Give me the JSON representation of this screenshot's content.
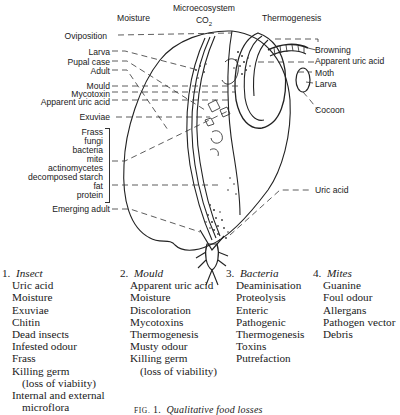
{
  "figure": {
    "header_labels": {
      "moisture": "Moisture",
      "microecosystem": "Microecosystem",
      "co2": "CO",
      "co2_sub": "2",
      "thermogenesis": "Thermogenesis"
    },
    "left_labels": [
      {
        "id": "oviposition",
        "text": "Oviposition"
      },
      {
        "id": "larva",
        "text": "Larva"
      },
      {
        "id": "pupal_case",
        "text": "Pupal case"
      },
      {
        "id": "adult",
        "text": "Adult"
      },
      {
        "id": "mould",
        "text": "Mould"
      },
      {
        "id": "mycotoxin",
        "text": "Mycotoxin"
      },
      {
        "id": "apparent_uric_acid",
        "text": "Apparent uric acid"
      },
      {
        "id": "exuviae",
        "text": "Exuviae"
      }
    ],
    "bracket_group": [
      "Frass",
      "fungi",
      "bacteria",
      "mite",
      "actinomycetes",
      "decomposed starch",
      "fat",
      "protein"
    ],
    "emerging_adult": "Emerging adult",
    "right_labels": [
      {
        "id": "browning",
        "text": "Browning"
      },
      {
        "id": "apparent_uric_acid_r",
        "text": "Apparent uric acid"
      },
      {
        "id": "moth",
        "text": "Moth"
      },
      {
        "id": "larva_r",
        "text": "Larva"
      },
      {
        "id": "cocoon",
        "text": "Cocoon"
      },
      {
        "id": "uric_acid",
        "text": "Uric acid"
      }
    ]
  },
  "categories": [
    {
      "number": "1.",
      "title": "Insect",
      "items": [
        "Uric acid",
        "Moisture",
        "Exuviae",
        "Chitin",
        "Dead insects",
        "Infested odour",
        "Frass",
        "Killing germ",
        "(loss of viabiity)",
        "Internal and external",
        "microflora"
      ]
    },
    {
      "number": "2.",
      "title": "Mould",
      "items": [
        "Apparent uric acid",
        "Moisture",
        "Discoloration",
        "Mycotoxins",
        "Thermogenesis",
        "Musty odour",
        "Killing germ",
        "(loss of viability)"
      ]
    },
    {
      "number": "3.",
      "title": "Bacteria",
      "items": [
        "Deaminisation",
        "Proteolysis",
        "Enteric",
        "Pathogenic",
        "Thermogenesis",
        "Toxins",
        "Putrefaction"
      ]
    },
    {
      "number": "4.",
      "title": "Mites",
      "items": [
        "Guanine",
        "Foul odour",
        "Allergans",
        "Pathogen vector",
        "Debris"
      ]
    }
  ],
  "caption": {
    "prefix": "FIG.",
    "number": "1.",
    "text": "Qualitative food losses"
  }
}
